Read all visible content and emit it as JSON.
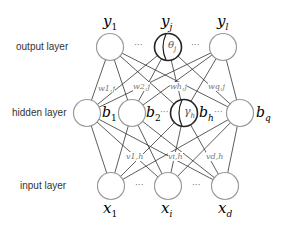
{
  "layers": {
    "output": {
      "label": "output layer",
      "nodes": [
        {
          "name": "y1",
          "label": "y",
          "sub": "1"
        },
        {
          "name": "yj",
          "label": "y",
          "sub": "j",
          "inner": "θ",
          "inner_sub": "j",
          "highlighted": true
        },
        {
          "name": "yl",
          "label": "y",
          "sub": "l"
        }
      ],
      "ellipsis": "···"
    },
    "hidden": {
      "label": "hidden layer",
      "nodes": [
        {
          "name": "b1",
          "label": "b",
          "sub": "1"
        },
        {
          "name": "b2",
          "label": "b",
          "sub": "2"
        },
        {
          "name": "bh",
          "label": "b",
          "sub": "h",
          "inner": "γ",
          "inner_sub": "h",
          "highlighted": true
        },
        {
          "name": "bq",
          "label": "b",
          "sub": "q"
        }
      ],
      "ellipsis": "···"
    },
    "input": {
      "label": "input layer",
      "nodes": [
        {
          "name": "x1",
          "label": "x",
          "sub": "1"
        },
        {
          "name": "xi",
          "label": "x",
          "sub": "i"
        },
        {
          "name": "xd",
          "label": "x",
          "sub": "d"
        }
      ],
      "ellipsis": "···"
    }
  },
  "weights": {
    "hidden_to_output": [
      "w1,j",
      "w2,j",
      "wh,j",
      "wq,j"
    ],
    "input_to_hidden": [
      "v1,h",
      "vi,h",
      "vd,h"
    ]
  },
  "colors": {
    "node_stroke": "#9a9a9a",
    "highlight_stroke": "#222222",
    "edge": "#333333",
    "weight_label": "#777777"
  }
}
